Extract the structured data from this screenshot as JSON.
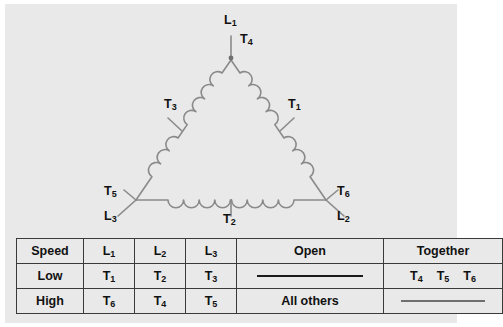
{
  "diagram": {
    "name": "delta-connected two-speed motor winding",
    "labels": {
      "apex_line": "L1",
      "apex_tap": "T4",
      "left_leg_tap": "T3",
      "right_leg_tap": "T1",
      "bottom_left_tap": "T5",
      "bottom_left_line": "L3",
      "bottom_center_tap": "T2",
      "bottom_right_tap": "T6",
      "bottom_right_line": "L2"
    },
    "colors": {
      "panel_bg": "#e9e9e9",
      "wire": "#8a8a8a",
      "text": "#111111",
      "muted_text": "#8d8d8d"
    }
  },
  "table": {
    "headers": [
      "Speed",
      "L1",
      "L2",
      "L3",
      "Open",
      "Together"
    ],
    "rows": [
      {
        "speed": "Low",
        "l1": "T1",
        "l2": "T2",
        "l3": "T3",
        "open": "",
        "together": [
          "T4",
          "T5",
          "T6"
        ],
        "open_is_dash": true,
        "together_is_dash": false
      },
      {
        "speed": "High",
        "l1": "T6",
        "l2": "T4",
        "l3": "T5",
        "open": "All others",
        "together": [],
        "open_is_dash": false,
        "together_is_dash": true
      }
    ]
  }
}
